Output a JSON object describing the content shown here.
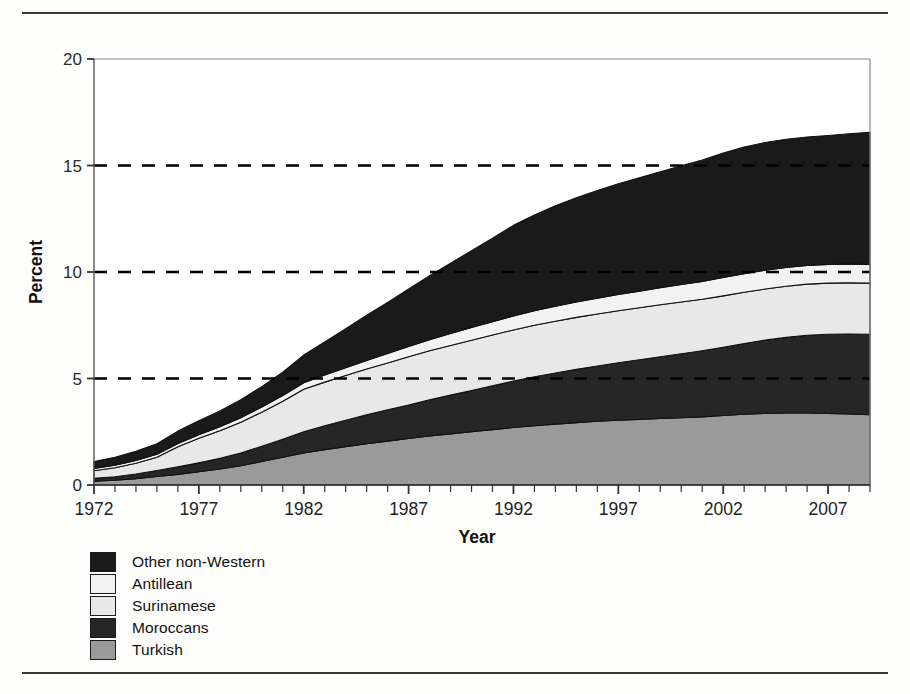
{
  "figure": {
    "top_rule": "",
    "bottom_rule": ""
  },
  "axes": {
    "ylabel": "Percent",
    "xlabel": "Year",
    "yticks": [
      "0",
      "5",
      "10",
      "15",
      "20"
    ],
    "xticks": [
      "1972",
      "1977",
      "1982",
      "1987",
      "1992",
      "1997",
      "2002",
      "2007"
    ]
  },
  "legend": {
    "items": [
      {
        "label": "Other non-Western",
        "color": "#1a1a1a"
      },
      {
        "label": "Antillean",
        "color": "#f2f2f2"
      },
      {
        "label": "Surinamese",
        "color": "#e8e8e8"
      },
      {
        "label": "Moroccans",
        "color": "#262626"
      },
      {
        "label": "Turkish",
        "color": "#9a9a9a"
      }
    ]
  },
  "chart_data": {
    "type": "area",
    "stacked": true,
    "title": "",
    "xlabel": "Year",
    "ylabel": "Percent",
    "xlim": [
      1972,
      2009
    ],
    "ylim": [
      0,
      20
    ],
    "yticks": [
      0,
      5,
      10,
      15,
      20
    ],
    "xticks": [
      1972,
      1977,
      1982,
      1987,
      1992,
      1997,
      2002,
      2007
    ],
    "grid": "dashed horizontal gridlines at 5, 10, 15",
    "legend_position": "below-left",
    "x": [
      1972,
      1973,
      1974,
      1975,
      1976,
      1977,
      1978,
      1979,
      1980,
      1981,
      1982,
      1983,
      1984,
      1985,
      1986,
      1987,
      1988,
      1989,
      1990,
      1991,
      1992,
      1993,
      1994,
      1995,
      1996,
      1997,
      1998,
      1999,
      2000,
      2001,
      2002,
      2003,
      2004,
      2005,
      2006,
      2007,
      2008,
      2009
    ],
    "series": [
      {
        "name": "Turkish",
        "color": "#9a9a9a",
        "values": [
          0.18,
          0.22,
          0.3,
          0.4,
          0.5,
          0.62,
          0.75,
          0.9,
          1.1,
          1.3,
          1.5,
          1.66,
          1.8,
          1.94,
          2.06,
          2.18,
          2.3,
          2.4,
          2.5,
          2.6,
          2.7,
          2.78,
          2.86,
          2.93,
          2.99,
          3.04,
          3.08,
          3.12,
          3.16,
          3.2,
          3.26,
          3.32,
          3.36,
          3.38,
          3.38,
          3.36,
          3.33,
          3.3
        ]
      },
      {
        "name": "Moroccans",
        "color": "#262626",
        "values": [
          0.14,
          0.17,
          0.22,
          0.28,
          0.35,
          0.42,
          0.5,
          0.6,
          0.72,
          0.85,
          1.0,
          1.12,
          1.24,
          1.36,
          1.47,
          1.58,
          1.7,
          1.82,
          1.94,
          2.06,
          2.18,
          2.3,
          2.4,
          2.5,
          2.6,
          2.7,
          2.8,
          2.9,
          3.0,
          3.1,
          3.2,
          3.32,
          3.44,
          3.55,
          3.65,
          3.72,
          3.76,
          3.78
        ]
      },
      {
        "name": "Surinamese",
        "color": "#e8e8e8",
        "values": [
          0.35,
          0.42,
          0.5,
          0.62,
          0.95,
          1.15,
          1.3,
          1.45,
          1.6,
          1.78,
          2.0,
          2.05,
          2.1,
          2.15,
          2.2,
          2.26,
          2.3,
          2.33,
          2.36,
          2.38,
          2.4,
          2.42,
          2.43,
          2.44,
          2.44,
          2.44,
          2.44,
          2.44,
          2.43,
          2.42,
          2.42,
          2.41,
          2.4,
          2.4,
          2.4,
          2.4,
          2.4,
          2.4
        ]
      },
      {
        "name": "Antillean",
        "color": "#f2f2f2",
        "values": [
          0.11,
          0.12,
          0.13,
          0.14,
          0.15,
          0.17,
          0.19,
          0.21,
          0.24,
          0.27,
          0.3,
          0.33,
          0.36,
          0.4,
          0.44,
          0.48,
          0.52,
          0.56,
          0.6,
          0.63,
          0.66,
          0.68,
          0.7,
          0.72,
          0.74,
          0.76,
          0.78,
          0.8,
          0.82,
          0.84,
          0.86,
          0.87,
          0.88,
          0.88,
          0.88,
          0.88,
          0.88,
          0.88
        ]
      },
      {
        "name": "Other non-Western",
        "color": "#1a1a1a",
        "values": [
          0.32,
          0.37,
          0.43,
          0.5,
          0.58,
          0.66,
          0.74,
          0.84,
          0.96,
          1.1,
          1.3,
          1.56,
          1.84,
          2.12,
          2.4,
          2.7,
          3.0,
          3.3,
          3.6,
          3.92,
          4.25,
          4.5,
          4.72,
          4.9,
          5.05,
          5.2,
          5.32,
          5.45,
          5.58,
          5.7,
          5.84,
          5.95,
          6.0,
          6.02,
          6.03,
          6.05,
          6.12,
          6.2
        ]
      }
    ]
  }
}
